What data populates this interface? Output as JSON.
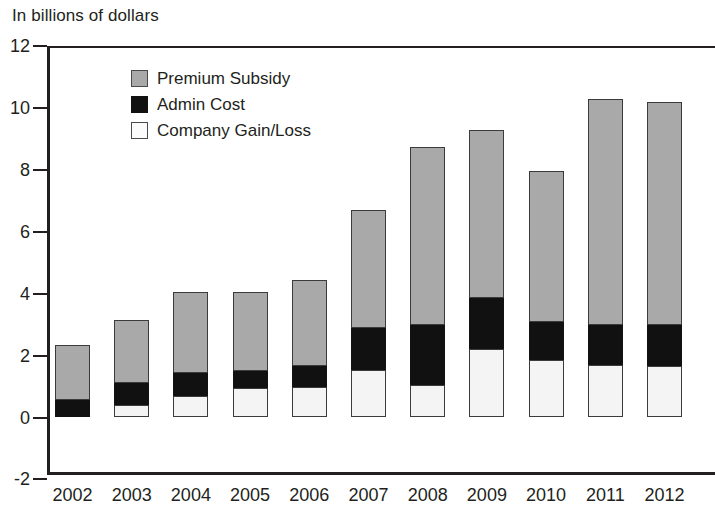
{
  "header": {
    "unit_label": "In billions of dollars"
  },
  "legend": {
    "position": "inside-top-left",
    "items": [
      {
        "label": "Premium Subsidy",
        "color": "#a9a9a9",
        "swatch": "premium-subsidy-swatch"
      },
      {
        "label": "Admin Cost",
        "color": "#111111",
        "swatch": "admin-cost-swatch"
      },
      {
        "label": "Company Gain/Loss",
        "color": "#f4f4f4",
        "swatch": "company-gain-loss-swatch"
      }
    ]
  },
  "axes": {
    "y_ticks": [
      "12",
      "10",
      "8",
      "6",
      "4",
      "2",
      "0",
      "-2"
    ],
    "y_tick_values": [
      12,
      10,
      8,
      6,
      4,
      2,
      0,
      -2
    ],
    "x_ticks": [
      "2002",
      "2003",
      "2004",
      "2005",
      "2006",
      "2007",
      "2008",
      "2009",
      "2010",
      "2011",
      "2012"
    ]
  },
  "chart_data": {
    "type": "bar",
    "stacked": true,
    "title": "",
    "subtitle": "",
    "xlabel": "",
    "ylabel": "In billions of dollars",
    "ylim": [
      -2,
      12
    ],
    "ytick_step": 2,
    "grid": false,
    "legend_position": "inside-top-left",
    "categories": [
      "2002",
      "2003",
      "2004",
      "2005",
      "2006",
      "2007",
      "2008",
      "2009",
      "2010",
      "2011",
      "2012"
    ],
    "series": [
      {
        "name": "Company Gain/Loss",
        "color": "#f4f4f4",
        "values": [
          0.0,
          0.4,
          0.7,
          0.95,
          1.0,
          1.55,
          1.05,
          2.2,
          1.85,
          1.7,
          1.65
        ]
      },
      {
        "name": "Admin Cost",
        "color": "#111111",
        "values": [
          0.55,
          0.7,
          0.75,
          0.55,
          0.65,
          1.35,
          1.95,
          1.65,
          1.25,
          1.3,
          1.35
        ]
      },
      {
        "name": "Premium Subsidy",
        "color": "#a9a9a9",
        "values": [
          1.8,
          2.05,
          1.85,
          2.55,
          2.8,
          3.8,
          5.75,
          5.45,
          4.85,
          7.3,
          7.2
        ]
      }
    ],
    "stack_tops": {
      "gain": [
        0.0,
        0.4,
        0.7,
        0.95,
        1.0,
        1.55,
        1.05,
        2.2,
        1.85,
        1.7,
        1.65
      ],
      "admin": [
        0.55,
        1.1,
        1.45,
        1.5,
        1.65,
        2.9,
        3.0,
        3.85,
        3.1,
        3.0,
        3.0
      ],
      "total": [
        2.35,
        3.15,
        4.05,
        4.05,
        4.45,
        6.7,
        8.75,
        9.3,
        7.95,
        10.3,
        10.2
      ]
    },
    "note": "Last bar (2012) is clipped by the right edge of the image"
  }
}
